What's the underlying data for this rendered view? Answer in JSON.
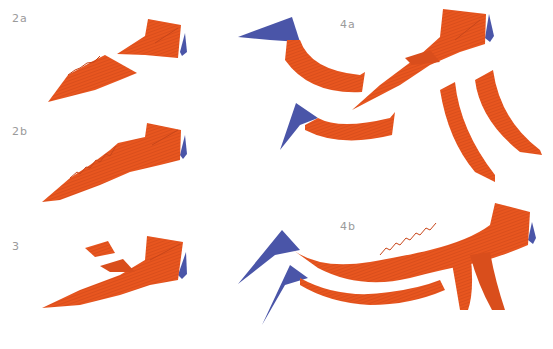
{
  "steps": [
    {
      "id": "2a",
      "label": "2a"
    },
    {
      "id": "2b",
      "label": "2b"
    },
    {
      "id": "3",
      "label": "3"
    },
    {
      "id": "4a",
      "label": "4a"
    },
    {
      "id": "4b",
      "label": "4b"
    }
  ],
  "colors": {
    "paper_orange": "#e8561f",
    "paper_orange_dark": "#c8461a",
    "paper_blue": "#4a55a8",
    "label_gray": "#9a9a9a",
    "background": "#ffffff"
  }
}
